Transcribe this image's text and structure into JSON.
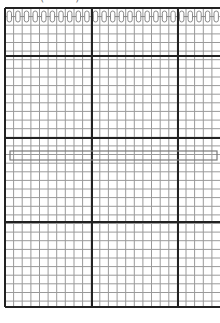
{
  "chart": {
    "caption_clipped": "(••••) ••• •• ••••",
    "grid": {
      "left": 5,
      "top": 8,
      "right": 220,
      "bottom": 307,
      "cell": 8.62,
      "minor_color": "#9a9a9a",
      "major_color": "#222222",
      "major_vertical_x": [
        5,
        92,
        178
      ],
      "major_horizontal_y": [
        8,
        56,
        138,
        222,
        307
      ]
    },
    "chain_row": {
      "y": 11,
      "height": 11,
      "count": 25,
      "color": "#8a8a8a"
    },
    "highlight_row": {
      "x": 10,
      "y": 151,
      "width": 207,
      "height": 9,
      "color": "#7a7a7a"
    }
  }
}
